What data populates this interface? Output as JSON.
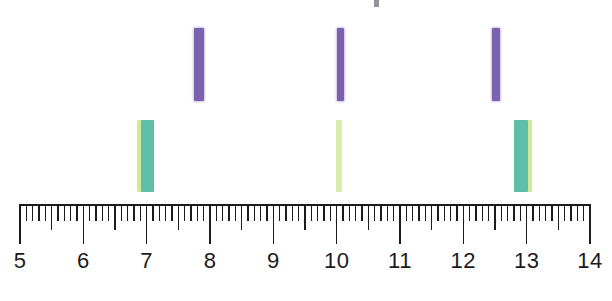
{
  "figure": {
    "type": "ruler-measurement-diagram"
  },
  "chart_data": {
    "type": "bar",
    "title": "",
    "xlabel": "",
    "ylabel": "",
    "xlim": [
      5,
      14
    ],
    "grid": false,
    "axis": {
      "min": 5,
      "max": 14,
      "major_step": 1,
      "half_step": 0.5,
      "minor_step": 0.1,
      "tick_labels": [
        "5",
        "6",
        "7",
        "8",
        "9",
        "10",
        "11",
        "12",
        "13",
        "14"
      ],
      "tick_values": [
        5,
        6,
        7,
        8,
        9,
        10,
        11,
        12,
        13,
        14
      ]
    },
    "series": [
      {
        "name": "purple-markers",
        "color": "#7b62ae",
        "row": "upper",
        "values": [
          7.8,
          10.0,
          12.6
        ],
        "widths": [
          0.14,
          0.09,
          0.11
        ]
      },
      {
        "name": "green-markers",
        "color": "#5dbfa8",
        "secondary_color": "#cfe89a",
        "row": "lower",
        "values": [
          7.0,
          10.0,
          13.0
        ],
        "widths": [
          0.2,
          0.07,
          0.2
        ]
      }
    ],
    "markers": {
      "purple": [
        {
          "label": "purple-bar-1",
          "value": 7.8,
          "color": "#7b62ae"
        },
        {
          "label": "purple-bar-2",
          "value": 10.0,
          "color": "#7b62ae"
        },
        {
          "label": "purple-bar-3",
          "value": 12.6,
          "color": "#7b62ae"
        }
      ],
      "green": [
        {
          "label": "green-bar-1",
          "value": 7.0,
          "core_color": "#5dbfa8",
          "edge_color": "#cfe89a",
          "edge_side": "left"
        },
        {
          "label": "green-bar-2",
          "value": 10.0,
          "core_color": "#d8ecae",
          "edge_color": "#d8ecae",
          "edge_side": "none"
        },
        {
          "label": "green-bar-3",
          "value": 13.0,
          "core_color": "#5dbfa8",
          "edge_color": "#cfe89a",
          "edge_side": "right"
        }
      ]
    }
  },
  "colors": {
    "purple": "#7b62ae",
    "teal": "#5dbfa8",
    "lime": "#cfe89a",
    "pale_lime": "#d8ecae",
    "ink": "#1b1b1b",
    "background": "#ffffff"
  },
  "labels": {
    "n5": "5",
    "n6": "6",
    "n7": "7",
    "n8": "8",
    "n9": "9",
    "n10": "10",
    "n11": "11",
    "n12": "12",
    "n13": "13",
    "n14": "14"
  }
}
